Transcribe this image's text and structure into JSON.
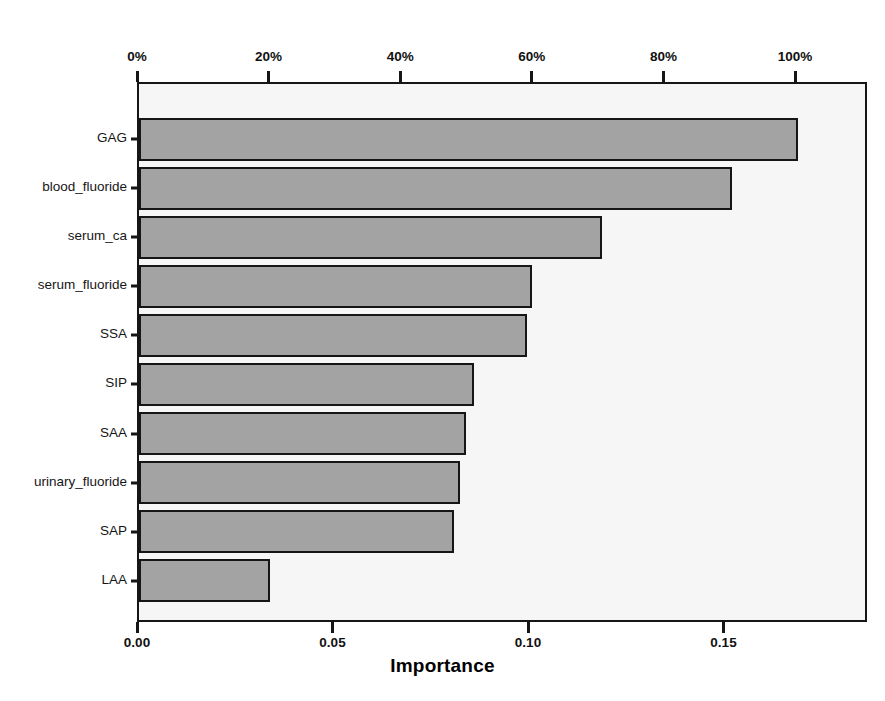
{
  "chart": {
    "type": "bar",
    "orientation": "horizontal",
    "top_title": "Normalized Importance",
    "bottom_title": "Importance"
  },
  "chart_data": {
    "type": "bar",
    "xlabel": "Importance",
    "ylabel": "",
    "orientation": "horizontal",
    "grid": false,
    "legend": null,
    "categories": [
      "GAG",
      "blood_fluoride",
      "serum_ca",
      "serum_fluoride",
      "SSA",
      "SIP",
      "SAA",
      "urinary_fluoride",
      "SAP",
      "LAA"
    ],
    "values": [
      0.1685,
      0.1517,
      0.1184,
      0.1005,
      0.0992,
      0.0857,
      0.0836,
      0.0821,
      0.0806,
      0.0335
    ],
    "normalized_values_percent": [
      100.0,
      90.0,
      70.3,
      59.6,
      58.9,
      50.9,
      49.6,
      48.7,
      47.8,
      19.9
    ],
    "xlim": [
      0.0,
      0.1868
    ],
    "top_axis": {
      "label": "Normalized Importance",
      "ticks": [
        "0%",
        "20%",
        "40%",
        "60%",
        "80%",
        "100%"
      ],
      "tick_values": [
        0,
        20,
        40,
        60,
        80,
        100
      ],
      "range_percent": [
        0,
        113.6
      ]
    },
    "bottom_axis": {
      "label": "Importance",
      "ticks": [
        "0.00",
        "0.05",
        "0.10",
        "0.15"
      ],
      "tick_values": [
        0.0,
        0.05,
        0.1,
        0.15
      ]
    },
    "bar_color": "#a3a3a3",
    "bar_edge_color": "#161616",
    "plot_background": "#f6f6f6"
  }
}
